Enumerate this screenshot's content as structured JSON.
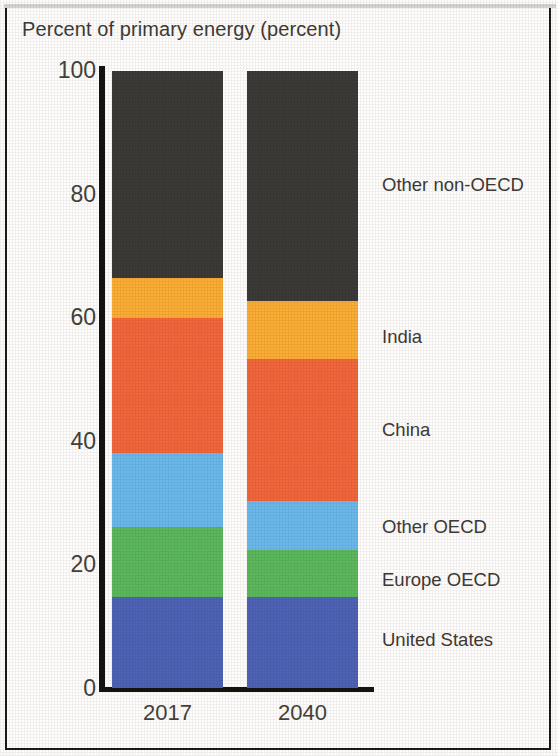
{
  "chart_data": {
    "type": "bar",
    "title": "Percent of primary energy (percent)",
    "xlabel": "",
    "ylabel": "",
    "categories": [
      "2017",
      "2040"
    ],
    "ylim": [
      0,
      100
    ],
    "yticks": [
      "0",
      "20",
      "40",
      "60",
      "80",
      "100"
    ],
    "grid": false,
    "legend_position": "right-inline",
    "stacked": true,
    "series": [
      {
        "name": "United States",
        "color": "#4e63b6",
        "values": [
          14.7,
          14.7
        ]
      },
      {
        "name": "Europe OECD",
        "color": "#5cb85c",
        "values": [
          11.3,
          7.6
        ]
      },
      {
        "name": "Other OECD",
        "color": "#6bb8ea",
        "values": [
          12.1,
          7.9
        ]
      },
      {
        "name": "China",
        "color": "#f2663c",
        "values": [
          21.7,
          23.1
        ]
      },
      {
        "name": "India",
        "color": "#fbad34",
        "values": [
          6.6,
          9.4
        ]
      },
      {
        "name": "Other non-OECD",
        "color": "#3c3a36",
        "values": [
          33.5,
          37.2
        ]
      }
    ]
  },
  "legend_labels": [
    "Other non-OECD",
    "India",
    "China",
    "Other OECD",
    "Europe OECD",
    "United States"
  ]
}
